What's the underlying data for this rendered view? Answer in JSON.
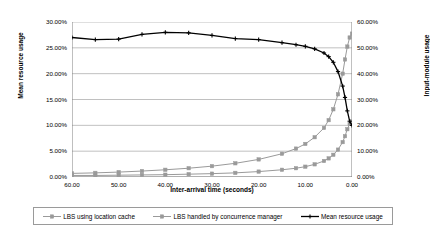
{
  "chart_data": {
    "type": "line",
    "title": "",
    "xlabel": "Inter-arrival time (seconds)",
    "ylabel": "Mean resource usage",
    "ylabel_right": "Input-module usage",
    "xlim": [
      60,
      0
    ],
    "x_reversed": true,
    "ylim": [
      0,
      0.3
    ],
    "ylim_right": [
      0,
      0.6
    ],
    "grid": true,
    "legend_position": "bottom",
    "xticks": [
      "60.00",
      "50.00",
      "40.00",
      "30.00",
      "20.00",
      "10.00",
      "0.00"
    ],
    "xtick_values": [
      60,
      50,
      40,
      30,
      20,
      10,
      0
    ],
    "yticks_left": [
      "0.00%",
      "5.00%",
      "10.00%",
      "15.00%",
      "20.00%",
      "25.00%",
      "30.00%"
    ],
    "ytick_values_left": [
      0,
      5,
      10,
      15,
      20,
      25,
      30
    ],
    "yticks_right": [
      "0.00%",
      "10.00%",
      "20.00%",
      "30.00%",
      "40.00%",
      "50.00%",
      "60.00%"
    ],
    "ytick_values_right": [
      0,
      10,
      20,
      30,
      40,
      50,
      60
    ],
    "x": [
      60,
      55,
      50,
      45,
      40,
      35,
      30,
      25,
      20,
      15,
      12,
      10,
      8,
      6,
      5,
      4,
      3,
      2,
      1.5,
      1,
      0.5,
      0
    ],
    "series": [
      {
        "name": "LBS using location cache",
        "axis": "right",
        "color": "#9a9a9a",
        "marker": "square",
        "values": [
          0.6,
          0.6,
          0.7,
          0.8,
          0.9,
          1.1,
          1.3,
          1.6,
          2.1,
          2.8,
          3.4,
          4.0,
          4.9,
          6.2,
          7.2,
          8.6,
          10.6,
          13.5,
          15.8,
          18.5,
          20.6,
          21.5
        ]
      },
      {
        "name": "LBS handled by concurrence manager",
        "axis": "right",
        "color": "#9a9a9a",
        "marker": "square",
        "values": [
          1.4,
          1.6,
          1.9,
          2.3,
          2.8,
          3.4,
          4.2,
          5.3,
          6.8,
          9.0,
          11.0,
          12.8,
          15.4,
          19.0,
          22.0,
          26.2,
          32.0,
          40.0,
          45.5,
          50.5,
          54.0,
          55.5
        ]
      },
      {
        "name": "Mean resource usage",
        "axis": "left",
        "color": "#000000",
        "marker": "cross",
        "values": [
          27.0,
          26.6,
          26.7,
          27.6,
          28.0,
          27.9,
          27.4,
          26.8,
          26.6,
          26.0,
          25.6,
          25.3,
          24.8,
          24.0,
          23.3,
          22.2,
          20.4,
          17.6,
          15.4,
          12.8,
          10.8,
          10.0
        ]
      }
    ]
  },
  "legend": {
    "entries": [
      {
        "label": "LBS using location cache"
      },
      {
        "label": "LBS handled by concurrence manager"
      },
      {
        "label": "Mean resource usage"
      }
    ]
  }
}
